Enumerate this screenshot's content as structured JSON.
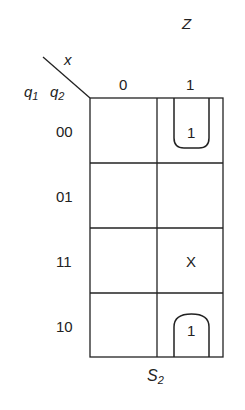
{
  "title": "Z",
  "caption": {
    "base": "S",
    "sub": "2"
  },
  "axes": {
    "column_variable": "x",
    "row_variables": [
      {
        "base": "q",
        "sub": "1"
      },
      {
        "base": "q",
        "sub": "2"
      }
    ]
  },
  "columns": [
    "0",
    "1"
  ],
  "rows": [
    "00",
    "01",
    "11",
    "10"
  ],
  "cells": [
    [
      "",
      "1"
    ],
    [
      "",
      ""
    ],
    [
      "",
      "X"
    ],
    [
      "",
      "1"
    ]
  ],
  "groups": [
    {
      "description": "wrap-around group covering rows 00 and 10 in column x=1",
      "cells": [
        [
          0,
          1
        ],
        [
          3,
          1
        ]
      ]
    }
  ]
}
